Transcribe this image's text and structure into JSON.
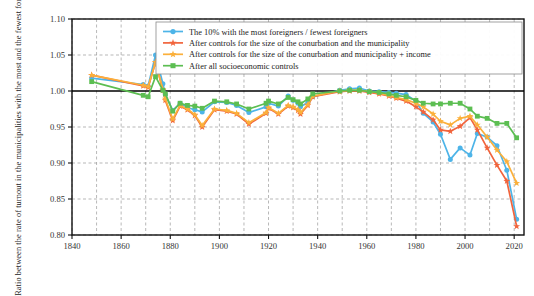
{
  "chart_data": {
    "type": "line",
    "title": "",
    "xlabel": "",
    "ylabel": "Ratio between the rate of turnout in the municipalities with the most and the fewest foreigners",
    "xlim": [
      1840,
      2024
    ],
    "ylim": [
      0.8,
      1.1
    ],
    "xticks": [
      1840,
      1860,
      1880,
      1900,
      1920,
      1940,
      1960,
      1980,
      2000,
      2020
    ],
    "yticks": [
      0.8,
      0.85,
      0.9,
      0.95,
      1.0,
      1.05,
      1.1
    ],
    "ytick_labels": [
      "0.80",
      "0.85",
      "0.90",
      "0.95",
      "1.00",
      "1.05",
      "1.10"
    ],
    "xtick_labels": [
      "1840",
      "1860",
      "1880",
      "1900",
      "1920",
      "1940",
      "1960",
      "1980",
      "2000",
      "2020"
    ],
    "grid": true,
    "grid_style": "dashed",
    "minor_xticks_every": 10,
    "reference_line_y": 1.0,
    "legend_position": "top-right",
    "series": [
      {
        "name": "The 10% with the most foreigners / fewest foreigners",
        "color": "#4DB4E8",
        "marker": "circle",
        "x": [
          1848,
          1869,
          1871,
          1874,
          1877,
          1878,
          1881,
          1884,
          1887,
          1890,
          1893,
          1898,
          1903,
          1907,
          1912,
          1919,
          1920,
          1924,
          1928,
          1930,
          1932,
          1933,
          1936,
          1938,
          1949,
          1953,
          1957,
          1961,
          1965,
          1969,
          1972,
          1976,
          1980,
          1983,
          1987,
          1990,
          1994,
          1998,
          2002,
          2005,
          2009,
          2013,
          2017,
          2021
        ],
        "y": [
          1.018,
          1.009,
          1.007,
          1.05,
          1.01,
          0.995,
          0.973,
          0.983,
          0.977,
          0.974,
          0.971,
          0.985,
          0.984,
          0.98,
          0.97,
          0.978,
          0.983,
          0.979,
          0.993,
          0.987,
          0.983,
          0.978,
          0.984,
          0.992,
          1.001,
          1.003,
          1.004,
          1.0,
          0.999,
          0.998,
          0.997,
          0.995,
          0.986,
          0.969,
          0.957,
          0.94,
          0.905,
          0.921,
          0.911,
          0.941,
          0.936,
          0.924,
          0.89,
          0.822
        ]
      },
      {
        "name": "After controls for the size of the conurbation and the municipality",
        "color": "#F1643C",
        "marker": "star",
        "x": [
          1848,
          1869,
          1871,
          1874,
          1877,
          1878,
          1881,
          1884,
          1887,
          1890,
          1893,
          1898,
          1903,
          1907,
          1912,
          1919,
          1920,
          1924,
          1928,
          1930,
          1932,
          1933,
          1936,
          1938,
          1949,
          1953,
          1957,
          1961,
          1965,
          1969,
          1972,
          1976,
          1980,
          1983,
          1987,
          1990,
          1994,
          1998,
          2002,
          2005,
          2009,
          2013,
          2017,
          2021
        ],
        "y": [
          1.022,
          1.007,
          1.005,
          1.04,
          1.001,
          0.987,
          0.959,
          0.979,
          0.974,
          0.966,
          0.95,
          0.974,
          0.972,
          0.968,
          0.954,
          0.969,
          0.976,
          0.968,
          0.979,
          0.977,
          0.973,
          0.968,
          0.98,
          0.992,
          0.999,
          1.0,
          1.0,
          0.998,
          0.996,
          0.993,
          0.99,
          0.986,
          0.978,
          0.971,
          0.96,
          0.946,
          0.944,
          0.951,
          0.963,
          0.946,
          0.921,
          0.897,
          0.875,
          0.812
        ]
      },
      {
        "name": "After controls for the size of the conurbation and municipality + income",
        "color": "#FBB03B",
        "marker": "star",
        "x": [
          1848,
          1869,
          1871,
          1874,
          1877,
          1878,
          1881,
          1884,
          1887,
          1890,
          1893,
          1898,
          1903,
          1907,
          1912,
          1919,
          1920,
          1924,
          1928,
          1930,
          1932,
          1933,
          1936,
          1938,
          1949,
          1953,
          1957,
          1961,
          1965,
          1969,
          1972,
          1976,
          1980,
          1983,
          1987,
          1990,
          1994,
          1998,
          2002,
          2005,
          2009,
          2013,
          2017,
          2021
        ],
        "y": [
          1.022,
          1.008,
          1.006,
          1.04,
          1.002,
          0.989,
          0.961,
          0.98,
          0.975,
          0.967,
          0.952,
          0.975,
          0.973,
          0.969,
          0.956,
          0.97,
          0.977,
          0.969,
          0.98,
          0.978,
          0.974,
          0.97,
          0.981,
          0.993,
          1.0,
          1.001,
          1.001,
          0.999,
          0.997,
          0.994,
          0.991,
          0.988,
          0.983,
          0.978,
          0.968,
          0.958,
          0.953,
          0.962,
          0.965,
          0.953,
          0.936,
          0.918,
          0.902,
          0.872
        ]
      },
      {
        "name": "After all socioeconomic controls",
        "color": "#5CBE52",
        "marker": "square",
        "x": [
          1848,
          1869,
          1871,
          1874,
          1877,
          1878,
          1881,
          1884,
          1887,
          1890,
          1893,
          1898,
          1903,
          1907,
          1912,
          1919,
          1920,
          1924,
          1928,
          1930,
          1932,
          1933,
          1936,
          1938,
          1949,
          1953,
          1957,
          1961,
          1965,
          1969,
          1972,
          1976,
          1980,
          1983,
          1987,
          1990,
          1994,
          1998,
          2002,
          2005,
          2009,
          2013,
          2017,
          2021
        ],
        "y": [
          1.013,
          0.994,
          0.992,
          1.02,
          1.001,
          0.996,
          0.972,
          0.983,
          0.98,
          0.979,
          0.976,
          0.986,
          0.985,
          0.982,
          0.975,
          0.983,
          0.986,
          0.982,
          0.991,
          0.988,
          0.985,
          0.982,
          0.989,
          0.996,
          1.0,
          1.001,
          1.001,
          0.999,
          0.998,
          0.996,
          0.994,
          0.992,
          0.987,
          0.983,
          0.982,
          0.982,
          0.983,
          0.983,
          0.975,
          0.965,
          0.962,
          0.955,
          0.955,
          0.935
        ]
      }
    ]
  }
}
